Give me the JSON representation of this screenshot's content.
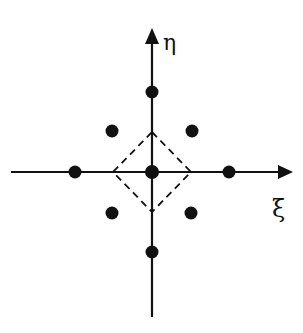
{
  "diagram": {
    "title": "",
    "axes": {
      "horizontal": {
        "label": "ξ",
        "direction": "right"
      },
      "vertical": {
        "label": "η",
        "direction": "up"
      }
    },
    "nodes": [
      {
        "id": "center",
        "label": "",
        "pos": [
          0,
          0
        ]
      },
      {
        "id": "right",
        "label": "",
        "pos": [
          2,
          0
        ]
      },
      {
        "id": "left",
        "label": "",
        "pos": [
          -2,
          0
        ]
      },
      {
        "id": "top",
        "label": "",
        "pos": [
          0,
          2
        ]
      },
      {
        "id": "bottom",
        "label": "",
        "pos": [
          0,
          -2
        ]
      },
      {
        "id": "upper-left",
        "label": "",
        "pos": [
          -1,
          1
        ]
      },
      {
        "id": "upper-right",
        "label": "",
        "pos": [
          1,
          1
        ]
      },
      {
        "id": "lower-left",
        "label": "",
        "pos": [
          -1,
          -1
        ]
      },
      {
        "id": "lower-right",
        "label": "",
        "pos": [
          1,
          -1
        ]
      }
    ],
    "shapes": [
      {
        "type": "dashed-diamond",
        "vertices": [
          [
            0,
            1
          ],
          [
            1,
            0
          ],
          [
            0,
            -1
          ],
          [
            -1,
            0
          ]
        ]
      }
    ],
    "colors": {
      "ink": "#111111",
      "background": "#ffffff"
    }
  }
}
